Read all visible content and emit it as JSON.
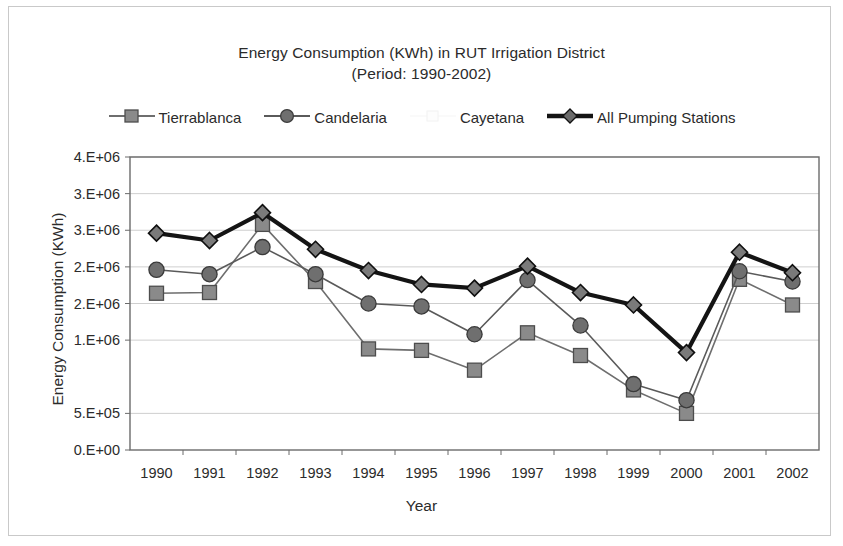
{
  "chart_data": {
    "type": "line",
    "title": "Energy Consumption (KWh) in RUT Irrigation District",
    "subtitle": "(Period: 1990-2002)",
    "xlabel": "Year",
    "ylabel": "Energy Consumption (KWh)",
    "categories": [
      "1990",
      "1991",
      "1992",
      "1993",
      "1994",
      "1995",
      "1996",
      "1997",
      "1998",
      "1999",
      "2000",
      "2001",
      "2002"
    ],
    "ylim": [
      0,
      4000000
    ],
    "ytick_values": [
      4000000,
      3500000,
      3000000,
      2500000,
      2000000,
      1500000,
      500000,
      0
    ],
    "ytick_labels": [
      "4.E+06",
      "3.E+06",
      "3.E+06",
      "2.E+06",
      "2.E+06",
      "1.E+06",
      "5.E+05",
      "0.E+00"
    ],
    "gridlines": "horizontal",
    "legend_position": "top",
    "series": [
      {
        "name": "Tierrablanca",
        "marker": "square",
        "color": "#6e6e6e",
        "line_width": 1.6,
        "values": [
          2140000,
          2150000,
          3080000,
          2300000,
          1380000,
          1360000,
          1090000,
          1600000,
          1290000,
          820000,
          500000,
          2330000,
          1980000
        ]
      },
      {
        "name": "Candelaria",
        "marker": "circle",
        "color": "#5a5a5a",
        "line_width": 1.6,
        "values": [
          2460000,
          2400000,
          2770000,
          2400000,
          2000000,
          1960000,
          1580000,
          2320000,
          1700000,
          900000,
          680000,
          2440000,
          2300000
        ]
      },
      {
        "name": "Cayetana",
        "marker": "none",
        "color": "#fbfbfb",
        "line_width": 1.2,
        "values": [
          null,
          null,
          null,
          null,
          null,
          null,
          null,
          null,
          null,
          null,
          null,
          null,
          null
        ]
      },
      {
        "name": "All Pumping Stations",
        "marker": "diamond",
        "color": "#141414",
        "line_width": 4.2,
        "values": [
          2960000,
          2860000,
          3240000,
          2740000,
          2450000,
          2260000,
          2210000,
          2510000,
          2150000,
          1980000,
          1330000,
          2700000,
          2420000
        ]
      }
    ]
  },
  "legend": {
    "items": [
      {
        "label": "Tierrablanca",
        "marker": "square-marker-icon"
      },
      {
        "label": "Candelaria",
        "marker": "circle-marker-icon"
      },
      {
        "label": "Cayetana",
        "marker": "blank-marker-icon"
      },
      {
        "label": "All Pumping Stations",
        "marker": "diamond-marker-icon"
      }
    ]
  },
  "colors": {
    "plot_border": "#6b6b6b",
    "grid": "#cfcfcf",
    "outer_frame": "#c9c9c9",
    "text": "#2b2b2b",
    "background": "#ffffff"
  }
}
